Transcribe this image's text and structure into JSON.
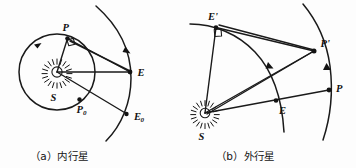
{
  "figure": {
    "name": "planet-elongation-geometry",
    "background_color": "#fdfdfd",
    "stroke_color": "#1a1a1a",
    "width": 356,
    "height": 168
  },
  "panel_a": {
    "caption": "（a）内行星",
    "caption_label": "(a) Inner planet",
    "sun_label": "S",
    "planet_label": "P",
    "planet_ref_label": "P",
    "planet_ref_sub": "0",
    "earth_label": "E",
    "earth_ref_label": "E",
    "earth_ref_sub": "0",
    "has_right_angle_at": "P",
    "inner_orbit": "planet circular orbit around S",
    "outer_arc": "earth orbit arc"
  },
  "panel_b": {
    "caption": "（b）外行星",
    "caption_label": "(b) Outer planet",
    "sun_label": "S",
    "earth_prime_label": "E'",
    "earth_label": "E",
    "planet_prime_label": "P'",
    "planet_label": "P",
    "has_right_angle_at": "E'",
    "inner_arc": "earth orbit arc",
    "outer_arc": "planet orbit arc"
  }
}
